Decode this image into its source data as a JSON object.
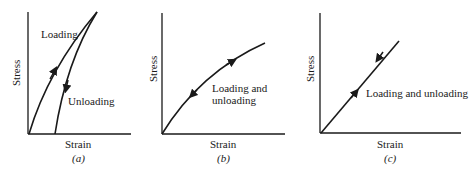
{
  "panels": [
    {
      "id": "a",
      "caption": "(a)",
      "y_label": "Stress",
      "x_label": "Strain",
      "annotations": [
        "Loading",
        "Unloading"
      ]
    },
    {
      "id": "b",
      "caption": "(b)",
      "y_label": "Stress",
      "x_label": "Strain",
      "annotations": [
        "Loading and",
        "unloading"
      ]
    },
    {
      "id": "c",
      "caption": "(c)",
      "y_label": "Stress",
      "x_label": "Strain",
      "annotations": [
        "Loading and unloading"
      ]
    }
  ],
  "colors": {
    "ink": "#1a1a1a",
    "background": "#ffffff"
  }
}
